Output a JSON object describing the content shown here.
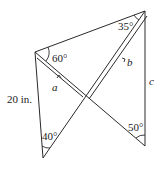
{
  "diagram": {
    "type": "geometry-figure",
    "vertices": {
      "top_left": {
        "x": 35,
        "y": 52,
        "angle_label": "60°"
      },
      "top_right": {
        "x": 145,
        "y": 11,
        "angle_label": "35°"
      },
      "bottom_left": {
        "x": 43,
        "y": 158,
        "angle_label": "40°"
      },
      "bottom_right": {
        "x": 145,
        "y": 146,
        "angle_label": "50°"
      },
      "crossing": {
        "x": 86,
        "y": 97
      }
    },
    "labels": {
      "side_left": "20 in.",
      "side_a": "a",
      "side_b": "b",
      "side_c": "c",
      "angle_top_left": "60°",
      "angle_top_right": "35°",
      "angle_bottom_left": "40°",
      "angle_bottom_right": "50°"
    },
    "stroke_color": "#2a2a2a"
  }
}
